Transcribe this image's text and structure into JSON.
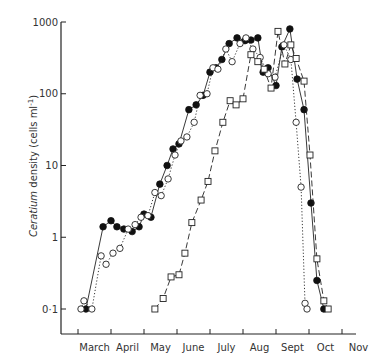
{
  "chart_data": {
    "type": "line",
    "title": "",
    "xlabel": "",
    "ylabel": "Ceratium density (cells ml⁻¹)",
    "ylabel_italic": "Ceratium",
    "ylabel_rest": " density (cells ml",
    "ylabel_sup": "-1",
    "ylabel_close": ")",
    "yscale": "log",
    "ylim": [
      0.05,
      1000
    ],
    "yticks": [
      0.1,
      1,
      10,
      100,
      1000
    ],
    "ytick_labels": [
      "0·1",
      "1",
      "10",
      "100",
      "1000"
    ],
    "xlim": [
      -0.35,
      8.1
    ],
    "x_unit": "months since start of March",
    "categories": [
      "March",
      "April",
      "May",
      "June",
      "July",
      "Aug",
      "Sept",
      "Oct",
      "Nov"
    ],
    "grid": false,
    "legend": "none",
    "series": [
      {
        "name": "filled circles (solid line)",
        "marker": "filled-circle",
        "line": "solid",
        "points": [
          [
            0.24,
            0.1
          ],
          [
            0.76,
            1.4
          ],
          [
            1.0,
            1.7
          ],
          [
            1.18,
            1.4
          ],
          [
            1.39,
            1.3
          ],
          [
            1.64,
            1.2
          ],
          [
            1.85,
            1.4
          ],
          [
            2.0,
            2.1
          ],
          [
            2.21,
            1.9
          ],
          [
            2.48,
            5.5
          ],
          [
            2.7,
            10
          ],
          [
            2.88,
            17
          ],
          [
            3.06,
            20
          ],
          [
            3.36,
            60
          ],
          [
            3.58,
            70
          ],
          [
            3.79,
            95
          ],
          [
            4.0,
            200
          ],
          [
            4.18,
            230
          ],
          [
            4.36,
            300
          ],
          [
            4.58,
            500
          ],
          [
            4.82,
            600
          ],
          [
            5.06,
            550
          ],
          [
            5.24,
            560
          ],
          [
            5.45,
            600
          ],
          [
            5.61,
            200
          ],
          [
            5.76,
            230
          ],
          [
            6.0,
            130
          ],
          [
            6.18,
            450
          ],
          [
            6.42,
            800
          ],
          [
            6.64,
            160
          ],
          [
            6.85,
            60
          ],
          [
            7.06,
            3
          ],
          [
            7.24,
            0.25
          ],
          [
            7.45,
            0.1
          ]
        ]
      },
      {
        "name": "open circles (dotted line)",
        "marker": "open-circle",
        "line": "dotted",
        "points": [
          [
            0.09,
            0.1
          ],
          [
            0.18,
            0.13
          ],
          [
            0.42,
            0.1
          ],
          [
            0.7,
            0.55
          ],
          [
            0.85,
            0.42
          ],
          [
            1.06,
            0.6
          ],
          [
            1.27,
            0.7
          ],
          [
            1.52,
            1.3
          ],
          [
            1.73,
            1.5
          ],
          [
            1.91,
            1.9
          ],
          [
            2.12,
            2.0
          ],
          [
            2.33,
            4.2
          ],
          [
            2.52,
            3.8
          ],
          [
            2.73,
            6.5
          ],
          [
            2.94,
            14
          ],
          [
            3.12,
            22
          ],
          [
            3.3,
            25
          ],
          [
            3.52,
            40
          ],
          [
            3.7,
            95
          ],
          [
            3.91,
            100
          ],
          [
            4.09,
            230
          ],
          [
            4.24,
            220
          ],
          [
            4.48,
            420
          ],
          [
            4.67,
            280
          ],
          [
            4.91,
            500
          ],
          [
            5.09,
            600
          ],
          [
            5.3,
            420
          ],
          [
            5.52,
            320
          ],
          [
            5.76,
            190
          ],
          [
            5.97,
            170
          ],
          [
            6.24,
            480
          ],
          [
            6.45,
            300
          ],
          [
            6.61,
            40
          ],
          [
            6.76,
            5
          ],
          [
            6.88,
            0.12
          ],
          [
            6.94,
            0.1
          ]
        ]
      },
      {
        "name": "open squares (dashed line)",
        "marker": "open-square",
        "line": "dashed",
        "points": [
          [
            2.33,
            0.1
          ],
          [
            2.58,
            0.14
          ],
          [
            2.82,
            0.28
          ],
          [
            3.06,
            0.3
          ],
          [
            3.24,
            0.6
          ],
          [
            3.45,
            1.6
          ],
          [
            3.73,
            3.3
          ],
          [
            3.94,
            6
          ],
          [
            4.15,
            16
          ],
          [
            4.39,
            40
          ],
          [
            4.61,
            80
          ],
          [
            4.79,
            70
          ],
          [
            5.0,
            85
          ],
          [
            5.24,
            350
          ],
          [
            5.45,
            280
          ],
          [
            5.64,
            220
          ],
          [
            5.85,
            120
          ],
          [
            6.06,
            740
          ],
          [
            6.27,
            260
          ],
          [
            6.45,
            480
          ],
          [
            6.61,
            310
          ],
          [
            6.85,
            150
          ],
          [
            7.03,
            14
          ],
          [
            7.24,
            0.5
          ],
          [
            7.45,
            0.13
          ],
          [
            7.58,
            0.1
          ]
        ]
      }
    ]
  }
}
